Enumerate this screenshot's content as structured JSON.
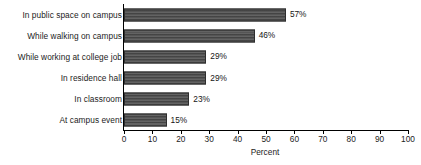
{
  "chart_data": {
    "type": "bar",
    "orientation": "horizontal",
    "title": "",
    "xlabel": "Percent",
    "ylabel": "",
    "xlim": [
      0,
      100
    ],
    "xticks": [
      0,
      10,
      20,
      30,
      40,
      50,
      60,
      70,
      80,
      90,
      100
    ],
    "grid": false,
    "legend": null,
    "categories": [
      "In public space on campus",
      "While walking on campus",
      "While working at college job",
      "In residence hall",
      "In classroom",
      "At campus event"
    ],
    "values": [
      57,
      46,
      29,
      29,
      23,
      15
    ],
    "data_labels": [
      "57%",
      "46%",
      "29%",
      "29%",
      "23%",
      "15%"
    ],
    "bar_color": "#4c4c4c",
    "axis_color": "#000000",
    "text_color": "#1c1c1c"
  }
}
